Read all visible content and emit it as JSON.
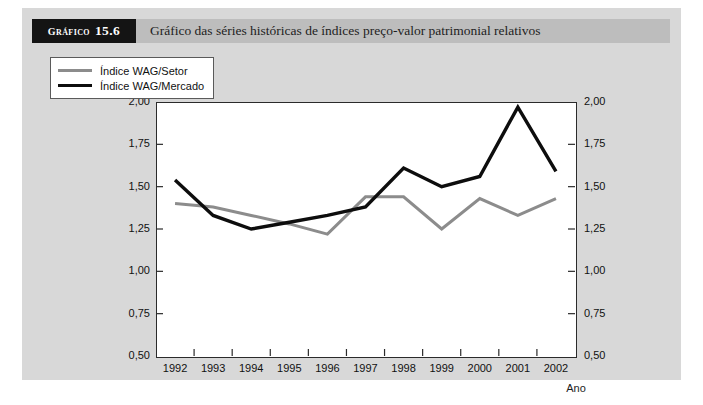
{
  "header": {
    "tag_word": "Gráfico",
    "tag_number": "15.6",
    "title": "Gráfico das séries históricas de índices preço-valor patrimonial relativos"
  },
  "colors": {
    "plate_background": "#d8d8d8",
    "header_strip": "#bdbdbd",
    "header_tag_background": "#141414",
    "plot_background": "#ffffff",
    "axis": "#2b2b2b",
    "series_setor": "#8c8c8c",
    "series_mercado": "#0d0d0d"
  },
  "chart_data": {
    "type": "line",
    "title": "Gráfico das séries históricas de índices preço-valor patrimonial relativos",
    "xlabel": "Ano",
    "ylabel": "Índices preço-valor\npatrimonial relativos",
    "x": [
      "1992",
      "1993",
      "1994",
      "1995",
      "1996",
      "1997",
      "1998",
      "1999",
      "2000",
      "2001",
      "2002"
    ],
    "ylim": [
      0.5,
      2.0
    ],
    "ytick_labels": [
      "2,00",
      "1,75",
      "1,50",
      "1,25",
      "1,00",
      "0,75",
      "0,50"
    ],
    "ytick_values": [
      2.0,
      1.75,
      1.5,
      1.25,
      1.0,
      0.75,
      0.5
    ],
    "grid": false,
    "legend_position": "upper-left-inside",
    "dual_axis": true,
    "series": [
      {
        "name": "Índice WAG/Setor",
        "color": "#8c8c8c",
        "values": [
          1.4,
          1.38,
          1.33,
          1.28,
          1.22,
          1.44,
          1.44,
          1.25,
          1.43,
          1.33,
          1.43
        ]
      },
      {
        "name": "Índice WAG/Mercado",
        "color": "#0d0d0d",
        "values": [
          1.54,
          1.33,
          1.25,
          1.29,
          1.33,
          1.38,
          1.61,
          1.5,
          1.56,
          1.97,
          1.59
        ]
      }
    ]
  }
}
